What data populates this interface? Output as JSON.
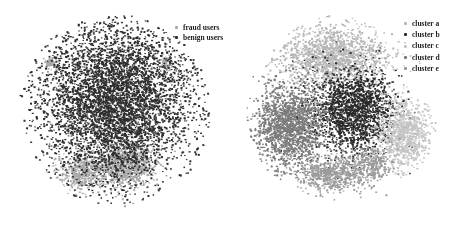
{
  "chart_data": [
    {
      "type": "scatter",
      "title": "",
      "xlabel": "",
      "ylabel": "",
      "grid": false,
      "axes_visible": false,
      "legend_position": "upper right",
      "legend": [
        {
          "label": "fraud users",
          "color": "#a8a8a8"
        },
        {
          "label": "benign users",
          "color": "#2e2e2e"
        }
      ],
      "series": [
        {
          "name": "fraud users",
          "color": "#a8a8a8",
          "regions": [
            {
              "cx": 0.55,
              "cy": 0.78,
              "rx": 0.16,
              "ry": 0.12,
              "n": 900
            },
            {
              "cx": 0.33,
              "cy": 0.82,
              "rx": 0.12,
              "ry": 0.09,
              "n": 450
            },
            {
              "cx": 0.16,
              "cy": 0.25,
              "rx": 0.03,
              "ry": 0.03,
              "n": 60
            },
            {
              "cx": 0.78,
              "cy": 0.25,
              "rx": 0.06,
              "ry": 0.05,
              "n": 60
            }
          ]
        },
        {
          "name": "benign users",
          "color": "#2e2e2e",
          "regions": [
            {
              "cx": 0.5,
              "cy": 0.45,
              "rx": 0.4,
              "ry": 0.4,
              "n": 5200
            }
          ]
        }
      ]
    },
    {
      "type": "scatter",
      "title": "",
      "xlabel": "",
      "ylabel": "",
      "grid": false,
      "axes_visible": false,
      "legend_position": "upper right",
      "legend": [
        {
          "label": "cluster a",
          "color": "#b5b5b5"
        },
        {
          "label": "cluster b",
          "color": "#2a2a2a"
        },
        {
          "label": "cluster c",
          "color": "#c4c4c4"
        },
        {
          "label": "cluster d",
          "color": "#7a7a7a"
        },
        {
          "label": "cluster e",
          "color": "#9a9a9a"
        }
      ],
      "series": [
        {
          "name": "cluster a",
          "color": "#b5b5b5",
          "regions": [
            {
              "cx": 0.45,
              "cy": 0.22,
              "rx": 0.28,
              "ry": 0.16,
              "n": 1500
            }
          ]
        },
        {
          "name": "cluster b",
          "color": "#2a2a2a",
          "regions": [
            {
              "cx": 0.55,
              "cy": 0.5,
              "rx": 0.22,
              "ry": 0.22,
              "n": 1900
            }
          ]
        },
        {
          "name": "cluster c",
          "color": "#c4c4c4",
          "regions": [
            {
              "cx": 0.82,
              "cy": 0.62,
              "rx": 0.13,
              "ry": 0.18,
              "n": 1000
            }
          ]
        },
        {
          "name": "cluster d",
          "color": "#7a7a7a",
          "regions": [
            {
              "cx": 0.22,
              "cy": 0.58,
              "rx": 0.18,
              "ry": 0.22,
              "n": 1700
            }
          ]
        },
        {
          "name": "cluster e",
          "color": "#9a9a9a",
          "regions": [
            {
              "cx": 0.45,
              "cy": 0.83,
              "rx": 0.18,
              "ry": 0.09,
              "n": 650
            },
            {
              "cx": 0.65,
              "cy": 0.78,
              "rx": 0.1,
              "ry": 0.1,
              "n": 300
            }
          ]
        }
      ]
    }
  ]
}
